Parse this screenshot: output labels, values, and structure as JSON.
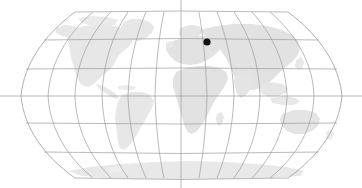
{
  "figure": {
    "name": "world-locator-map",
    "width": 362,
    "height": 188,
    "background_color": "#ffffff"
  },
  "chart_data": {
    "type": "map",
    "title": "",
    "subtitle": "",
    "xlabel": "",
    "ylabel": "",
    "projection": "robinson",
    "grid": true,
    "legend": false,
    "legend_position": "none",
    "map_bounds_px": {
      "left": 21,
      "right": 342,
      "top": 12,
      "bottom": 178
    },
    "graticule": {
      "meridian_interval_deg": 30,
      "parallel_interval_deg": 30,
      "meridian_count": 13,
      "parallel_count": 7,
      "meridian_longitudes": [
        -180,
        -150,
        -120,
        -90,
        -60,
        -30,
        0,
        30,
        60,
        90,
        120,
        150,
        180
      ],
      "parallel_latitudes": [
        90,
        60,
        30,
        0,
        -30,
        -60,
        -90
      ],
      "central_meridian_deg": 0,
      "equator_latitude_deg": 0,
      "line_color": "#9c9c9c",
      "equator_y_px": 96,
      "central_meridian_x_px": 181,
      "axis_lines_extend_to_canvas_edge": true
    },
    "land": {
      "color": "#e5e5e5",
      "color_secondary": "#e0e0e0",
      "regions": [
        "north-america",
        "south-america",
        "greenland",
        "europe",
        "africa",
        "asia",
        "australia",
        "antarctica"
      ]
    },
    "markers": [
      {
        "label": "",
        "x_px": 207,
        "y_px": 42,
        "radius_px": 3.6,
        "color": "#111111",
        "shape": "circle",
        "approx_lon_deg": 42,
        "approx_lat_deg": 55
      }
    ]
  }
}
